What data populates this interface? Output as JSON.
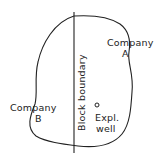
{
  "diagram": {
    "type": "oil field block boundary sketch",
    "colors": {
      "background": "#ffffff",
      "line": "#222222",
      "text": "#222222"
    },
    "labels": {
      "company_a_line1": "Company",
      "company_a_line2": "A",
      "company_b_line1": "Company",
      "company_b_line2": "B",
      "block_boundary": "Block boundary",
      "well_marker": "o",
      "well_line1": "Expl.",
      "well_line2": "well"
    },
    "elements": [
      {
        "id": "field-outline",
        "kind": "closed curve",
        "description": "irregular field outline"
      },
      {
        "id": "block-boundary-line",
        "kind": "vertical line",
        "description": "divides field between Company A (right) and Company B (left)"
      },
      {
        "id": "exploration-well",
        "kind": "point marker",
        "description": "exploration well on Company A side near boundary"
      }
    ]
  }
}
